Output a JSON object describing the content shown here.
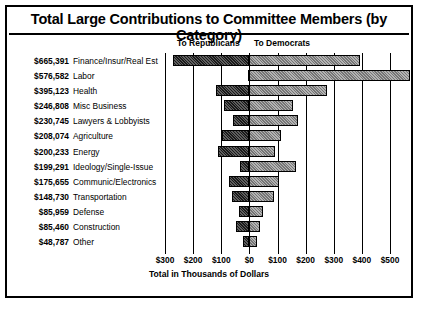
{
  "chart_data": {
    "type": "bar",
    "orientation": "horizontal",
    "style": "diverging-stacked",
    "title": "Total Large Contributions to Committee Members (by Category)",
    "xlabel": "Total in Thousands of Dollars",
    "ylabel": "",
    "left_header": "To Republicans",
    "right_header": "To Democrats",
    "xlim": [
      -300,
      500
    ],
    "xticks": [
      -300,
      -200,
      -100,
      0,
      100,
      200,
      300,
      400,
      500
    ],
    "xtick_labels": [
      "$300",
      "$200",
      "$100",
      "$0",
      "$100",
      "$200",
      "$300",
      "$400",
      "$500"
    ],
    "grid": true,
    "legend": "none",
    "units": "thousands of dollars",
    "categories": [
      "Finance/Insur/Real Est",
      "Labor",
      "Health",
      "Misc Business",
      "Lawyers & Lobbyists",
      "Agriculture",
      "Energy",
      "Ideology/Single-Issue",
      "Communic/Electronics",
      "Transportation",
      "Defense",
      "Construction",
      "Other"
    ],
    "totals": [
      "$665,391",
      "$576,582",
      "$395,123",
      "$246,808",
      "$230,745",
      "$208,074",
      "$200,233",
      "$199,291",
      "$175,655",
      "$148,730",
      "$85,959",
      "$85,460",
      "$48,787"
    ],
    "series": [
      {
        "name": "To Republicans",
        "color": "#1a1a1a",
        "values": [
          273,
          6,
          118,
          92,
          58,
          97,
          110,
          35,
          71,
          62,
          37,
          46,
          22
        ]
      },
      {
        "name": "To Democrats",
        "color": "#b3b3b3",
        "values": [
          392,
          571,
          277,
          155,
          173,
          111,
          90,
          164,
          105,
          87,
          49,
          39,
          27
        ]
      }
    ]
  }
}
